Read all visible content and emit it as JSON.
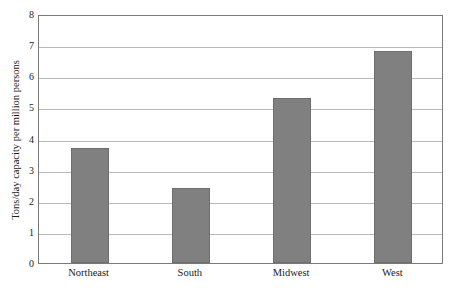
{
  "chart_data": {
    "type": "bar",
    "title": "",
    "xlabel": "",
    "ylabel": "Tons/day capacity per million persons",
    "categories": [
      "Northeast",
      "South",
      "Midwest",
      "West"
    ],
    "values": [
      3.7,
      2.4,
      5.3,
      6.8
    ],
    "ylim": [
      0,
      8
    ],
    "ytick_labels": [
      "0",
      "1",
      "2",
      "3",
      "4",
      "5",
      "6",
      "7",
      "8"
    ],
    "ytick_values": [
      0,
      1,
      2,
      3,
      4,
      5,
      6,
      7,
      8
    ],
    "grid": true,
    "grid_orientation": "horizontal",
    "legend": false,
    "legend_position": "none",
    "bar_color": "#808080",
    "bar_border_color": "#6e6e6e",
    "gridline_color": "#b9b9b9",
    "frame_color": "#7a7a7a",
    "background_color": "#ffffff",
    "text_color": "#1a1a1a"
  }
}
